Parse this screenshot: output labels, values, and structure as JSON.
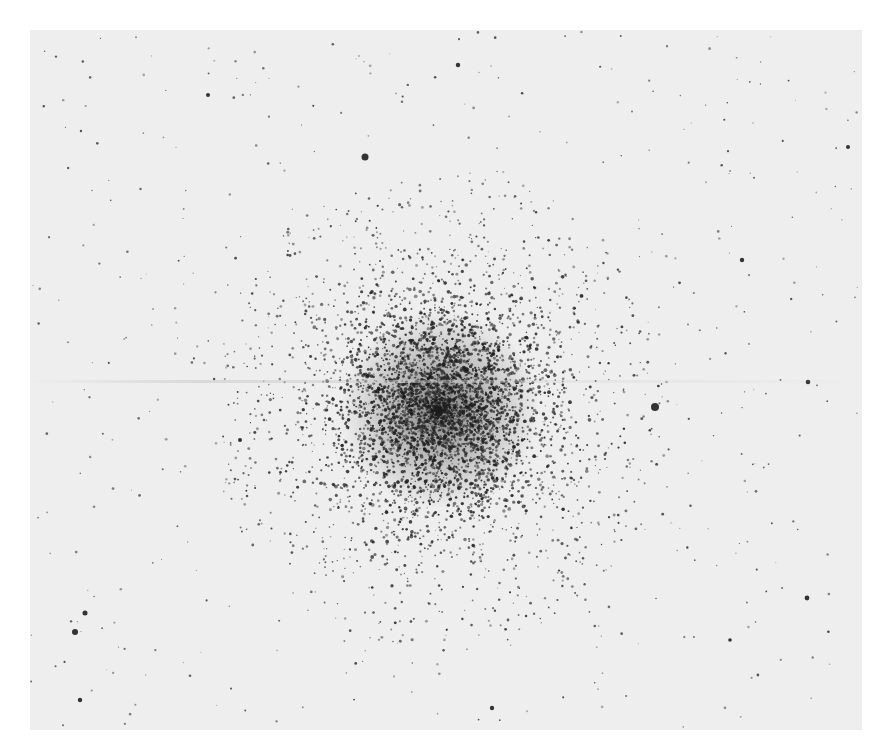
{
  "image": {
    "description": "Negative photographic plate of a globular star cluster",
    "colors": {
      "page_background": "#ffffff",
      "plate_background": "#eeeeee",
      "star": "#2a2a2a",
      "core": "#1e1e1e"
    }
  },
  "cluster": {
    "center_x": 410,
    "center_y": 380,
    "core_radius": 55,
    "halo_radius": 230,
    "core_star_count": 2600,
    "halo_star_count": 2600
  },
  "field": {
    "background_star_count": 520
  },
  "bright_stars": [
    {
      "x": 625,
      "y": 377,
      "r": 4.0
    },
    {
      "x": 335,
      "y": 127,
      "r": 3.5
    },
    {
      "x": 45,
      "y": 602,
      "r": 3.0
    },
    {
      "x": 55,
      "y": 583,
      "r": 2.5
    },
    {
      "x": 178,
      "y": 65,
      "r": 2.0
    },
    {
      "x": 428,
      "y": 35,
      "r": 2.2
    },
    {
      "x": 712,
      "y": 230,
      "r": 2.2
    },
    {
      "x": 778,
      "y": 352,
      "r": 2.3
    },
    {
      "x": 818,
      "y": 117,
      "r": 2.0
    },
    {
      "x": 777,
      "y": 568,
      "r": 2.4
    },
    {
      "x": 50,
      "y": 670,
      "r": 2.2
    },
    {
      "x": 462,
      "y": 678,
      "r": 2.2
    },
    {
      "x": 210,
      "y": 410,
      "r": 2.0
    },
    {
      "x": 700,
      "y": 610,
      "r": 1.8
    }
  ],
  "artifacts": {
    "streak_y": [
      350,
      382
    ]
  }
}
